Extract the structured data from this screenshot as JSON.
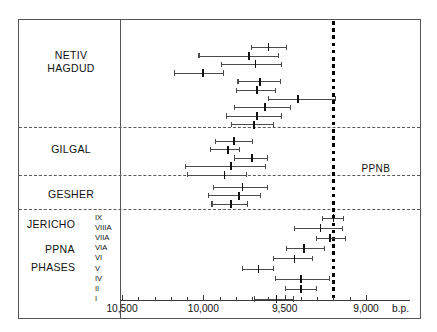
{
  "chart_data": {
    "type": "scatter",
    "title": "",
    "xlabel": "b.p.",
    "ylabel": "",
    "axis_unit_label": "b.p.",
    "xlim": [
      10600,
      8950
    ],
    "x_reversed": true,
    "tick_labels": [
      "10,500",
      "10,000",
      "9,500",
      "9,000"
    ],
    "tick_values": [
      10500,
      10000,
      9500,
      9000
    ],
    "minor_tick_step": 100,
    "grid": false,
    "annotations": [
      {
        "text": "PPNB",
        "value": 9200,
        "type": "boundary-label"
      }
    ],
    "boundary_line": {
      "label": "PPNB",
      "value": 9200,
      "style": "thick-dotted"
    },
    "groups": [
      {
        "name": "NETIV HAGDUD",
        "label_lines": [
          "NETIV",
          "HAGDUD"
        ],
        "points": [
          {
            "value": 9600,
            "low": 9710,
            "high": 9490
          },
          {
            "value": 9720,
            "low": 10030,
            "high": 9540
          },
          {
            "value": 9680,
            "low": 9890,
            "high": 9520
          },
          {
            "value": 10000,
            "low": 10180,
            "high": 9880
          },
          {
            "value": 9650,
            "low": 9790,
            "high": 9530
          },
          {
            "value": 9670,
            "low": 9800,
            "high": 9560
          },
          {
            "value": 9420,
            "low": 9600,
            "high": 9190
          },
          {
            "value": 9620,
            "low": 9810,
            "high": 9470
          },
          {
            "value": 9670,
            "low": 9860,
            "high": 9520
          },
          {
            "value": 9690,
            "low": 9830,
            "high": 9570
          }
        ]
      },
      {
        "name": "GILGAL",
        "label_lines": [
          "GILGAL"
        ],
        "points": [
          {
            "value": 9810,
            "low": 9930,
            "high": 9700
          },
          {
            "value": 9850,
            "low": 9960,
            "high": 9780
          },
          {
            "value": 9700,
            "low": 9810,
            "high": 9610
          },
          {
            "value": 9830,
            "low": 10110,
            "high": 9620
          },
          {
            "value": 9870,
            "low": 10100,
            "high": 9740
          }
        ]
      },
      {
        "name": "GESHER",
        "label_lines": [
          "GESHER"
        ],
        "points": [
          {
            "value": 9760,
            "low": 9940,
            "high": 9610
          },
          {
            "value": 9780,
            "low": 9970,
            "high": 9650
          },
          {
            "value": 9830,
            "low": 9950,
            "high": 9730
          }
        ]
      },
      {
        "name": "JERICHO PPNA PHASES",
        "label_lines": [
          "JERICHO",
          "PPNA",
          "PHASES"
        ],
        "phase_labels": [
          "IX",
          "VIIIA",
          "VIIA",
          "VIA",
          "VI",
          "V",
          "IV",
          "II",
          "I"
        ],
        "points": [
          {
            "phase": "IX",
            "value": 9200,
            "low": 9270,
            "high": 9140
          },
          {
            "phase": "VIIIA",
            "value": 9280,
            "low": 9440,
            "high": 9150
          },
          {
            "phase": "VIIA",
            "value": 9220,
            "low": 9310,
            "high": 9130
          },
          {
            "phase": "VIA",
            "value": 9380,
            "low": 9490,
            "high": 9260
          },
          {
            "phase": "VI",
            "value": 9440,
            "low": 9570,
            "high": 9330
          },
          {
            "phase": "V",
            "value": 9660,
            "low": 9760,
            "high": 9570
          },
          {
            "phase": "IV",
            "value": 9400,
            "low": 9560,
            "high": 9230
          },
          {
            "phase": "II",
            "value": 9400,
            "low": 9500,
            "high": 9310
          },
          {
            "phase": "I",
            "value": 9550,
            "low": 9690,
            "high": 9450
          }
        ]
      }
    ],
    "extra_points": [
      {
        "group": "JERICHO PPNA PHASES",
        "value": 9780,
        "low": 9900,
        "high": 9680
      },
      {
        "group": "JERICHO PPNA PHASES",
        "value": 10250,
        "low": 10440,
        "high": 10060
      },
      {
        "group": "JERICHO PPNA PHASES",
        "value": 10300,
        "low": 10500,
        "high": 10110
      }
    ]
  },
  "axis": {
    "labels": [
      "10,500",
      "10,000",
      "9,500",
      "9,000"
    ],
    "unit": "b.p."
  },
  "labels": {
    "netiv": "NETIV",
    "hagdud": "HAGDUD",
    "gilgal": "GILGAL",
    "gesher": "GESHER",
    "jericho": "JERICHO",
    "ppna": "PPNA",
    "phases": "PHASES",
    "ppnb": "PPNB"
  },
  "phases": [
    "IX",
    "VIIIA",
    "VIIA",
    "VIA",
    "VI",
    "V",
    "IV",
    "II",
    "I"
  ],
  "colors": {
    "frame": "#555555",
    "bar": "#4a4a4a",
    "point": "#111111",
    "boundary": "#000000",
    "background": "#ffffff"
  }
}
